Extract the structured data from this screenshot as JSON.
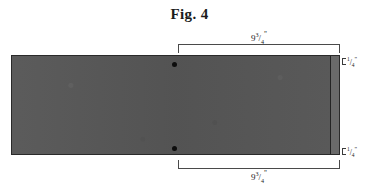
{
  "figure": {
    "title": "Fig. 4",
    "caption_prefix": "Fig.",
    "number": "4"
  },
  "drawing": {
    "type": "technical-dimensioned-panel",
    "panel_fill_color": "#565656",
    "panel_outline_color": "#2a2a2a",
    "edge_strip_color": "#6a6a6a",
    "hole_marker_color": "#0d0d0d",
    "background_color": "#ffffff"
  },
  "dimensions": {
    "top": {
      "whole": "9",
      "numerator": "3",
      "slash": "/",
      "denominator": "4",
      "unit": "\"",
      "full_text": "9 3/4\""
    },
    "bottom": {
      "whole": "9",
      "numerator": "3",
      "slash": "/",
      "denominator": "4",
      "unit": "\"",
      "full_text": "9 3/4\""
    },
    "edge_top": {
      "whole": "",
      "numerator": "1",
      "slash": "/",
      "denominator": "4",
      "unit": "\"",
      "full_text": "1/4\""
    },
    "edge_bottom": {
      "whole": "",
      "numerator": "1",
      "slash": "/",
      "denominator": "4",
      "unit": "\"",
      "full_text": "1/4\""
    }
  },
  "markers": {
    "hole_top_label": "hole-marker-top",
    "hole_bottom_label": "hole-marker-bottom"
  }
}
